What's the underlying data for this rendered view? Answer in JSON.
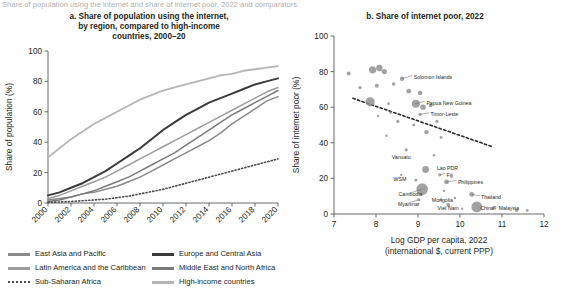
{
  "figure": {
    "clipped_header": "Share of population using the internet and share of internet poor, 2022 and comparators",
    "panel_a_title": "a. Share of population using the internet,\nby region, compared to high-income\ncountries, 2000–20",
    "panel_b_title": "b. Share of internet poor, 2022"
  },
  "chart_data": [
    {
      "type": "line",
      "title": "a. Share of population using the internet, by region, compared to high-income countries, 2000–20",
      "xlabel": "",
      "ylabel": "Share of population (%)",
      "xlim": [
        2000,
        2020
      ],
      "ylim": [
        0,
        100
      ],
      "yticks": [
        0,
        20,
        40,
        60,
        80,
        100
      ],
      "xticks": [
        2000,
        2002,
        2004,
        2006,
        2008,
        2010,
        2012,
        2014,
        2016,
        2018,
        2020
      ],
      "grid": false,
      "legend_position": "bottom",
      "x": [
        2000,
        2001,
        2002,
        2003,
        2004,
        2005,
        2006,
        2007,
        2008,
        2009,
        2010,
        2011,
        2012,
        2013,
        2014,
        2015,
        2016,
        2017,
        2018,
        2019,
        2020
      ],
      "series": [
        {
          "name": "East Asia and Pacific",
          "color": "#8a8a8a",
          "width": 1.5,
          "dash": "",
          "values": [
            2,
            3,
            4,
            6,
            7,
            9,
            11,
            14,
            17,
            21,
            25,
            29,
            33,
            37,
            41,
            46,
            52,
            57,
            62,
            67,
            70
          ]
        },
        {
          "name": "Europe and Central Asia",
          "color": "#3a3a3a",
          "width": 2.0,
          "dash": "",
          "values": [
            5,
            7,
            10,
            13,
            17,
            21,
            26,
            31,
            36,
            42,
            48,
            53,
            58,
            62,
            66,
            69,
            72,
            75,
            78,
            80,
            82
          ]
        },
        {
          "name": "Latin America and the Caribbean",
          "color": "#9c9c9c",
          "width": 1.5,
          "dash": "",
          "values": [
            3,
            5,
            8,
            11,
            14,
            17,
            21,
            25,
            29,
            33,
            37,
            41,
            45,
            49,
            53,
            57,
            61,
            65,
            69,
            73,
            76
          ]
        },
        {
          "name": "Middle East and North Africa",
          "color": "#7a7a7a",
          "width": 1.5,
          "dash": "",
          "values": [
            1,
            2,
            4,
            6,
            8,
            11,
            14,
            17,
            21,
            25,
            29,
            33,
            38,
            43,
            48,
            53,
            58,
            62,
            66,
            70,
            74
          ]
        },
        {
          "name": "Sub-Saharan Africa",
          "color": "#4d4d4d",
          "width": 1.6,
          "dash": "1.2 2.2",
          "values": [
            0.4,
            0.7,
            1,
            1.5,
            2,
            2.5,
            3.5,
            4.5,
            6,
            7.5,
            9,
            11,
            13,
            15,
            17,
            19,
            21,
            23,
            25,
            27,
            29
          ]
        },
        {
          "name": "High-income countries",
          "color": "#b5b5b5",
          "width": 1.8,
          "dash": "",
          "values": [
            30,
            36,
            42,
            47,
            52,
            56,
            60,
            64,
            68,
            71,
            74,
            76,
            78,
            80,
            82,
            84,
            85,
            87,
            88,
            89,
            90
          ]
        }
      ]
    },
    {
      "type": "scatter",
      "title": "b. Share of internet poor, 2022",
      "xlabel": "Log GDP per capita, 2022\n(international $, current PPP)",
      "xlabel_line1": "Log GDP per capita, 2022",
      "xlabel_line2": "(international $, current PPP)",
      "ylabel": "Share of internet poor (%)",
      "xlim": [
        7,
        12
      ],
      "ylim": [
        0,
        100
      ],
      "xticks": [
        7,
        8,
        9,
        10,
        11,
        12
      ],
      "yticks": [
        0,
        20,
        40,
        60,
        80,
        100
      ],
      "grid": false,
      "bubble_color": "#8e8e8e",
      "trendline": {
        "x0": 7.45,
        "y0": 65,
        "x1": 10.75,
        "y1": 38,
        "dash": "2.4 2.4",
        "color": "#2b2b2b",
        "width": 1.6
      },
      "points": [
        {
          "label": "",
          "x": 7.35,
          "y": 79,
          "r": 2.0
        },
        {
          "label": "",
          "x": 7.92,
          "y": 81,
          "r": 3.6
        },
        {
          "label": "",
          "x": 8.08,
          "y": 82,
          "r": 3.2
        },
        {
          "label": "",
          "x": 8.2,
          "y": 80,
          "r": 2.6
        },
        {
          "label": "Solomon Islands",
          "x": 8.62,
          "y": 76,
          "r": 2.2,
          "lx": 8.9,
          "ly": 77,
          "anchor": "start",
          "leader": true
        },
        {
          "label": "",
          "x": 7.62,
          "y": 71,
          "r": 1.6
        },
        {
          "label": "",
          "x": 8.02,
          "y": 72,
          "r": 2.0
        },
        {
          "label": "",
          "x": 8.42,
          "y": 73,
          "r": 1.8
        },
        {
          "label": "",
          "x": 8.78,
          "y": 69,
          "r": 2.4
        },
        {
          "label": "",
          "x": 9.05,
          "y": 68,
          "r": 2.2
        },
        {
          "label": "",
          "x": 7.86,
          "y": 63,
          "r": 4.6
        },
        {
          "label": "",
          "x": 8.3,
          "y": 62,
          "r": 1.4
        },
        {
          "label": "Papua New Guinea",
          "x": 8.95,
          "y": 62,
          "r": 4.0,
          "lx": 9.2,
          "ly": 62.5,
          "anchor": "start",
          "leader": true
        },
        {
          "label": "",
          "x": 9.12,
          "y": 60,
          "r": 2.8
        },
        {
          "label": "",
          "x": 9.3,
          "y": 61,
          "r": 1.8
        },
        {
          "label": "Timor-Leste",
          "x": 9.05,
          "y": 56,
          "r": 1.6,
          "lx": 9.3,
          "ly": 56,
          "anchor": "start",
          "leader": true
        },
        {
          "label": "",
          "x": 8.35,
          "y": 57,
          "r": 1.4
        },
        {
          "label": "",
          "x": 8.52,
          "y": 52,
          "r": 1.6
        },
        {
          "label": "",
          "x": 8.9,
          "y": 50,
          "r": 1.4
        },
        {
          "label": "",
          "x": 9.45,
          "y": 52,
          "r": 1.6
        },
        {
          "label": "",
          "x": 9.2,
          "y": 46,
          "r": 2.2
        },
        {
          "label": "",
          "x": 9.55,
          "y": 43,
          "r": 1.4
        },
        {
          "label": "Vanuatu",
          "x": 8.72,
          "y": 36,
          "r": 1.6,
          "lx": 8.6,
          "ly": 32,
          "anchor": "middle",
          "leader": false
        },
        {
          "label": "Lao PDR",
          "x": 9.18,
          "y": 25,
          "r": 3.4,
          "lx": 9.45,
          "ly": 26,
          "anchor": "start",
          "leader": false
        },
        {
          "label": "Fiji",
          "x": 9.52,
          "y": 22,
          "r": 1.6,
          "lx": 9.68,
          "ly": 22,
          "anchor": "start",
          "leader": true
        },
        {
          "label": "WSM",
          "x": 8.95,
          "y": 19,
          "r": 1.4,
          "lx": 8.72,
          "ly": 19.5,
          "anchor": "end",
          "leader": false
        },
        {
          "label": "Philippines",
          "x": 9.68,
          "y": 18,
          "r": 2.4,
          "lx": 9.95,
          "ly": 18,
          "anchor": "start",
          "leader": true
        },
        {
          "label": "Cambodia",
          "x": 9.1,
          "y": 14,
          "r": 5.8,
          "lx": 8.82,
          "ly": 11,
          "anchor": "middle",
          "leader": true
        },
        {
          "label": "Myanmar",
          "x": 9.02,
          "y": 8,
          "r": 1.6,
          "lx": 8.78,
          "ly": 5.5,
          "anchor": "middle",
          "leader": true
        },
        {
          "label": "Mongolia",
          "x": 9.55,
          "y": 8,
          "r": 1.4,
          "lx": 9.58,
          "ly": 8,
          "anchor": "middle",
          "leader": false
        },
        {
          "label": "Viet Nam",
          "x": 9.72,
          "y": 5,
          "r": 2.0,
          "lx": 9.72,
          "ly": 3.5,
          "anchor": "middle",
          "leader": false
        },
        {
          "label": "Thailand",
          "x": 10.28,
          "y": 11,
          "r": 2.4,
          "lx": 10.5,
          "ly": 9.5,
          "anchor": "start",
          "leader": true
        },
        {
          "label": "China",
          "x": 10.4,
          "y": 4,
          "r": 5.4,
          "lx": 10.48,
          "ly": 3.5,
          "anchor": "start",
          "leader": false
        },
        {
          "label": "Malaysia",
          "x": 10.82,
          "y": 3.5,
          "r": 2.0,
          "lx": 10.92,
          "ly": 3.5,
          "anchor": "start",
          "leader": false
        },
        {
          "label": "",
          "x": 11.35,
          "y": 2,
          "r": 1.6
        },
        {
          "label": "",
          "x": 11.6,
          "y": 2,
          "r": 1.4
        },
        {
          "label": "",
          "x": 10.05,
          "y": 3,
          "r": 1.2
        },
        {
          "label": "",
          "x": 9.88,
          "y": 9,
          "r": 1.2
        },
        {
          "label": "",
          "x": 8.6,
          "y": 22,
          "r": 1.2
        },
        {
          "label": "",
          "x": 9.38,
          "y": 33,
          "r": 1.2
        },
        {
          "label": "",
          "x": 8.25,
          "y": 44,
          "r": 1.2
        },
        {
          "label": "",
          "x": 8.05,
          "y": 55,
          "r": 1.2
        },
        {
          "label": "",
          "x": 9.62,
          "y": 13,
          "r": 1.2
        }
      ]
    }
  ],
  "legend": {
    "left": [
      {
        "label": "East Asia and Pacific",
        "color": "#8a8a8a",
        "style": "solid"
      },
      {
        "label": "Latin America and the Caribbean",
        "color": "#9c9c9c",
        "style": "solid"
      },
      {
        "label": "Sub-Saharan Africa",
        "color": "#4d4d4d",
        "style": "dotted"
      }
    ],
    "right": [
      {
        "label": "Europe and Central Asia",
        "color": "#3a3a3a",
        "style": "solid"
      },
      {
        "label": "Middle East and North Africa",
        "color": "#7a7a7a",
        "style": "solid"
      },
      {
        "label": "High-income countries",
        "color": "#b5b5b5",
        "style": "solid"
      }
    ]
  }
}
